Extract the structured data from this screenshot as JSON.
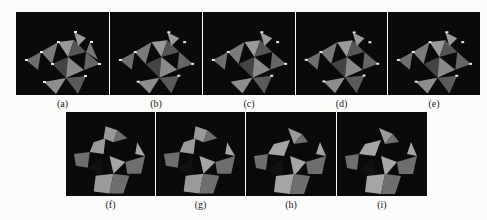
{
  "figure": {
    "top_row": [
      {
        "label": "(a)",
        "markers": true
      },
      {
        "label": "(b)",
        "markers": true
      },
      {
        "label": "(c)",
        "markers": true
      },
      {
        "label": "(d)",
        "markers": true
      },
      {
        "label": "(e)",
        "markers": true
      }
    ],
    "bottom_row": [
      {
        "label": "(f)",
        "style": "jagged"
      },
      {
        "label": "(g)",
        "style": "jagged"
      },
      {
        "label": "(h)",
        "style": "smooth"
      },
      {
        "label": "(i)",
        "style": "smooth"
      }
    ],
    "colors": {
      "background": "#0a0a0a",
      "light": "#9a9a9a",
      "mid": "#6e6e6e",
      "dark": "#4a4a4a",
      "marker": "#e8e8e8"
    }
  }
}
